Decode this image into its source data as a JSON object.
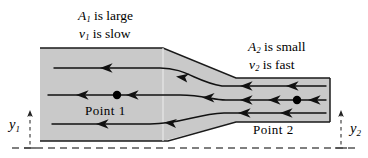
{
  "figure": {
    "colors": {
      "pipe_fill": "#c9c9c9",
      "pipe_stroke": "#1a1a1a",
      "streamline": "#111111",
      "dashed_guide": "#555555",
      "background": "#ffffff",
      "text": "#000000"
    },
    "labels": {
      "a1_var": "A",
      "a1_sub": "1",
      "a1_text": " is large",
      "v1_var": "v",
      "v1_sub": "1",
      "v1_text": " is slow",
      "a2_var": "A",
      "a2_sub": "2",
      "a2_text": " is small",
      "v2_var": "v",
      "v2_sub": "2",
      "v2_text": " is fast",
      "point1": "Point 1",
      "point2": "Point 2",
      "y1_var": "y",
      "y1_sub": "1",
      "y2_var": "y",
      "y2_sub": "2"
    },
    "geometry": {
      "wide_section": {
        "top_y": 48,
        "bottom_y": 141,
        "left_x": 40,
        "taper_start_x": 163
      },
      "narrow_section": {
        "top_y": 78,
        "bottom_y": 122,
        "right_x": 330,
        "taper_end_x": 236
      },
      "baseline_y": 148
    },
    "streamlines": [
      {
        "name": "upper-streamline",
        "start_y": 68,
        "end_y": 86,
        "arrow_count": 4
      },
      {
        "name": "center-streamline",
        "start_y": 95,
        "end_y": 100,
        "arrow_count": 6
      },
      {
        "name": "lower-streamline",
        "start_y": 124,
        "end_y": 113,
        "arrow_count": 4
      }
    ],
    "points": [
      {
        "name": "point-1-marker",
        "x": 117,
        "y": 95,
        "radius": 4.2
      },
      {
        "name": "point-2-marker",
        "x": 297,
        "y": 100,
        "radius": 4.2
      }
    ]
  }
}
